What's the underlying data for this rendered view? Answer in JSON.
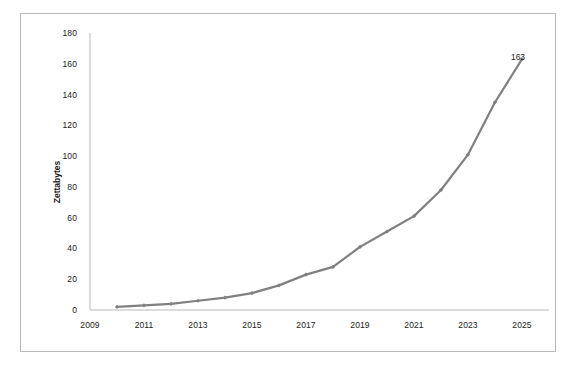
{
  "chart_data": {
    "type": "line",
    "title": "",
    "subtitle": "",
    "xlabel": "",
    "ylabel": "Zettabytes",
    "x": [
      2010,
      2011,
      2012,
      2013,
      2014,
      2015,
      2016,
      2017,
      2018,
      2019,
      2020,
      2021,
      2022,
      2023,
      2024,
      2025
    ],
    "values": [
      2,
      3,
      4,
      6,
      8,
      11,
      16,
      23,
      28,
      41,
      51,
      61,
      78,
      101,
      135,
      163
    ],
    "series": [
      {
        "name": "Global data volume",
        "values": [
          2,
          3,
          4,
          6,
          8,
          11,
          16,
          23,
          28,
          41,
          51,
          61,
          78,
          101,
          135,
          163
        ],
        "color": "#808080",
        "marker": "diamond"
      }
    ],
    "xlim": [
      2009,
      2026
    ],
    "ylim": [
      0,
      180
    ],
    "xticks": [
      2009,
      2011,
      2013,
      2015,
      2017,
      2019,
      2021,
      2023,
      2025
    ],
    "yticks": [
      0,
      20,
      40,
      60,
      80,
      100,
      120,
      140,
      160,
      180
    ],
    "xtick_labels": [
      "2009",
      "2011",
      "2013",
      "2015",
      "2017",
      "2019",
      "2021",
      "2023",
      "2025"
    ],
    "ytick_labels": [
      "0",
      "20",
      "40",
      "60",
      "80",
      "100",
      "120",
      "140",
      "160",
      "180"
    ],
    "grid": false,
    "legend": false,
    "legend_position": "none",
    "annotations": [
      {
        "text": "163",
        "x": 2025,
        "y": 163
      }
    ]
  },
  "frame": {
    "border_color": "#b9b9b9",
    "background": "#ffffff"
  }
}
